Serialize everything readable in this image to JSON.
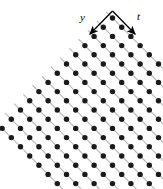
{
  "figure": {
    "name": "rotated-square-lattice-diagram",
    "caption": "",
    "background_color": "#ffffff",
    "width": 163,
    "height": 189
  },
  "axes": {
    "origin": {
      "x": 112.5,
      "y": 11.0
    },
    "labels": [
      {
        "id": "y",
        "text": "y",
        "style": "italic",
        "arrow_from": {
          "x": 112.5,
          "y": 11.0
        },
        "arrow_to": {
          "x": 90.0,
          "y": 34.0
        },
        "label_pos": {
          "x": 80,
          "y": 12
        }
      },
      {
        "id": "t",
        "text": "t",
        "style": "italic",
        "arrow_from": {
          "x": 112.5,
          "y": 11.0
        },
        "arrow_to": {
          "x": 135.0,
          "y": 34.0
        },
        "label_pos": {
          "x": 137,
          "y": 11
        }
      }
    ]
  },
  "chart_data": {
    "type": "scatter",
    "title": "",
    "xlabel": "t",
    "ylabel": "y",
    "grid": true,
    "legend": null,
    "lattice": {
      "rows": 13,
      "cols": 12,
      "origin_px": {
        "x": 112.5,
        "y": 18.0
      },
      "vector_y_px": {
        "dx": -9.2,
        "dy": 9.2
      },
      "vector_t_px": {
        "dx": 9.2,
        "dy": 9.2
      },
      "dot_radius_px": 2.7,
      "dot_color": "#1a1a1a"
    },
    "guide_lines": {
      "color": "#b8b8b8",
      "width_px": 1.1,
      "direction": "t",
      "count": 13,
      "extension_px": 9
    },
    "axis_arrow": {
      "color": "#000000",
      "width_px": 1.3,
      "head_length_px": 7,
      "head_width_px": 4
    }
  }
}
